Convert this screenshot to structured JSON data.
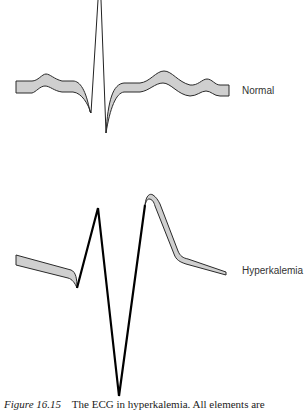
{
  "figure": {
    "panels": [
      {
        "id": "normal",
        "label": "Normal"
      },
      {
        "id": "hyperkalemia",
        "label": "Hyperkalemia"
      }
    ],
    "caption": {
      "number": "Figure 16.15",
      "text": "The ECG in hyperkalemia. All elements are"
    }
  },
  "colors": {
    "band_fill": "#cfcfcf",
    "stroke": "#222222",
    "background": "#ffffff"
  }
}
